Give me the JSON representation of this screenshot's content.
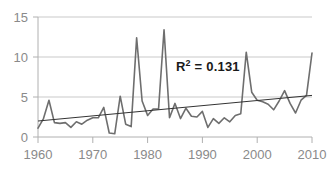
{
  "chart_data": {
    "type": "line",
    "title": "",
    "subtitle": "",
    "xlabel": "",
    "ylabel": "",
    "xlim": [
      1960,
      2010
    ],
    "ylim": [
      0,
      15
    ],
    "yticks": [
      0,
      5,
      10,
      15
    ],
    "ytick_labels": [
      "0",
      "5",
      "10",
      "15"
    ],
    "xticks": [
      1960,
      1970,
      1980,
      1990,
      2000,
      2010
    ],
    "xtick_labels": [
      "1960",
      "1970",
      "1980",
      "1990",
      "2000",
      "2010"
    ],
    "grid": "horizontal",
    "legend": "none",
    "annotations": [
      {
        "name": "r-squared",
        "text_prefix": "R",
        "text_superscript": "2",
        "text_suffix": " = 0.131",
        "full_text": "R2 = 0.131",
        "value": 0.131,
        "x": 1990,
        "y": 7.9
      }
    ],
    "x": [
      1960,
      1961,
      1962,
      1963,
      1964,
      1965,
      1966,
      1967,
      1968,
      1969,
      1970,
      1971,
      1972,
      1973,
      1974,
      1975,
      1976,
      1977,
      1978,
      1979,
      1980,
      1981,
      1982,
      1983,
      1984,
      1985,
      1986,
      1987,
      1988,
      1989,
      1990,
      1991,
      1992,
      1993,
      1994,
      1995,
      1996,
      1997,
      1998,
      1999,
      2000,
      2001,
      2002,
      2003,
      2004,
      2005,
      2006,
      2007,
      2008,
      2009,
      2010
    ],
    "series": [
      {
        "name": "annual-series",
        "color": "#6e6e6e",
        "values": [
          1.1,
          2.3,
          4.6,
          1.8,
          1.7,
          1.8,
          1.2,
          1.9,
          1.6,
          2.1,
          2.4,
          2.4,
          3.7,
          0.5,
          0.4,
          5.1,
          1.6,
          1.3,
          12.4,
          4.5,
          2.7,
          3.5,
          3.5,
          13.4,
          2.4,
          4.2,
          2.3,
          3.6,
          2.6,
          2.5,
          3.2,
          1.2,
          2.3,
          1.7,
          2.4,
          1.9,
          2.7,
          2.9,
          10.6,
          5.6,
          4.6,
          4.4,
          4.1,
          3.4,
          4.5,
          5.8,
          4.2,
          3.0,
          4.6,
          5.2,
          10.5
        ]
      },
      {
        "name": "linear-trendline",
        "color": "#333333",
        "type": "trend",
        "start": {
          "x": 1960,
          "y": 2.0
        },
        "end": {
          "x": 2010,
          "y": 5.2
        }
      }
    ]
  },
  "axis_labels": {
    "y": [
      "15",
      "10",
      "5",
      "0"
    ],
    "x": [
      "1960",
      "1970",
      "1980",
      "1990",
      "2000",
      "2010"
    ]
  },
  "annotation": {
    "r2_prefix": "R",
    "r2_sup": "2",
    "r2_suffix": " = 0.131"
  },
  "colors": {
    "series": "#6e6e6e",
    "trend": "#333333",
    "grid": "#c9c9c9",
    "axis": "#b0b0b0",
    "tick_text": "#8a8a8a",
    "annotation_text": "#1a1a1a",
    "background": "#ffffff"
  }
}
